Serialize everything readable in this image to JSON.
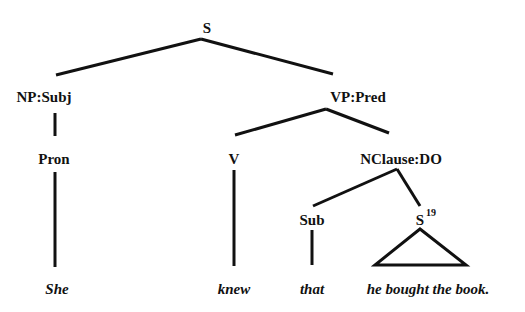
{
  "tree": {
    "nodes": {
      "s": "S",
      "np_subj": "NP:Subj",
      "vp_pred": "VP:Pred",
      "pron": "Pron",
      "v": "V",
      "nclause_do": "NClause:DO",
      "sub": "Sub",
      "s_inner": "S",
      "s_inner_sup": "19"
    },
    "words": {
      "she": "She",
      "knew": "knew",
      "that": "that",
      "clause": "he bought the book."
    }
  }
}
